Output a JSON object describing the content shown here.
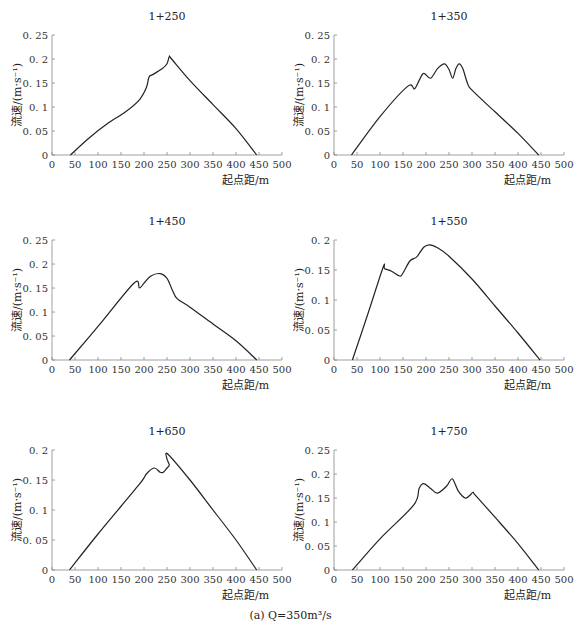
{
  "caption": "(a) Q=350m³/s",
  "x_axis_label": "起点距/m",
  "y_axis_label": "流速/(m·s⁻¹)",
  "chart_data": [
    {
      "type": "line",
      "title": "1+250",
      "xlabel": "起点距/m",
      "ylabel": "流速/(m·s⁻¹)",
      "xlim": [
        0,
        500
      ],
      "ylim": [
        0,
        0.25
      ],
      "xticks": [
        0,
        50,
        100,
        150,
        200,
        250,
        300,
        350,
        400,
        450,
        500
      ],
      "yticks": [
        "0",
        "0.05",
        "0.1",
        "0.15",
        "0.2",
        "0.25"
      ],
      "x": [
        40,
        80,
        120,
        160,
        190,
        205,
        210,
        213,
        220,
        240,
        250,
        255,
        260,
        300,
        350,
        400,
        445
      ],
      "y": [
        0,
        0.035,
        0.065,
        0.09,
        0.115,
        0.14,
        0.16,
        0.165,
        0.168,
        0.18,
        0.19,
        0.205,
        0.2,
        0.155,
        0.105,
        0.055,
        0
      ]
    },
    {
      "type": "line",
      "title": "1+350",
      "xlabel": "起点距/m",
      "ylabel": "流速/(m·s⁻¹)",
      "xlim": [
        0,
        500
      ],
      "ylim": [
        0,
        0.25
      ],
      "xticks": [
        0,
        50,
        100,
        150,
        200,
        250,
        300,
        350,
        400,
        450,
        500
      ],
      "yticks": [
        "0",
        "0.05",
        "0.1",
        "0.15",
        "0.2",
        "0.25"
      ],
      "x": [
        38,
        100,
        160,
        175,
        185,
        195,
        210,
        225,
        240,
        250,
        258,
        265,
        272,
        280,
        290,
        300,
        350,
        400,
        445
      ],
      "y": [
        0,
        0.08,
        0.143,
        0.138,
        0.155,
        0.17,
        0.16,
        0.18,
        0.19,
        0.178,
        0.16,
        0.18,
        0.19,
        0.18,
        0.15,
        0.135,
        0.09,
        0.045,
        0
      ]
    },
    {
      "type": "line",
      "title": "1+450",
      "xlabel": "起点距/m",
      "ylabel": "流速/(m·s⁻¹)",
      "xlim": [
        0,
        500
      ],
      "ylim": [
        0,
        0.25
      ],
      "xticks": [
        0,
        50,
        100,
        150,
        200,
        250,
        300,
        350,
        400,
        450,
        500
      ],
      "yticks": [
        "0",
        "0.05",
        "0.1",
        "0.15",
        "0.2",
        "0.25"
      ],
      "x": [
        38,
        100,
        178,
        190,
        200,
        215,
        235,
        250,
        262,
        272,
        300,
        350,
        400,
        445
      ],
      "y": [
        0,
        0.07,
        0.16,
        0.15,
        0.16,
        0.175,
        0.18,
        0.17,
        0.145,
        0.128,
        0.11,
        0.075,
        0.04,
        0
      ]
    },
    {
      "type": "line",
      "title": "1+550",
      "xlabel": "起点距/m",
      "ylabel": "流速/(m·s⁻¹)",
      "xlim": [
        0,
        500
      ],
      "ylim": [
        0,
        0.2
      ],
      "xticks": [
        0,
        50,
        100,
        150,
        200,
        250,
        300,
        350,
        400,
        450,
        500
      ],
      "yticks": [
        "0",
        "0.05",
        "0.1",
        "0.15",
        "0.2"
      ],
      "x": [
        40,
        75,
        107,
        110,
        125,
        143,
        150,
        165,
        180,
        195,
        208,
        225,
        250,
        300,
        350,
        400,
        448
      ],
      "y": [
        0,
        0.08,
        0.155,
        0.152,
        0.148,
        0.14,
        0.145,
        0.165,
        0.172,
        0.188,
        0.192,
        0.187,
        0.173,
        0.135,
        0.09,
        0.045,
        0
      ]
    },
    {
      "type": "line",
      "title": "1+650",
      "xlabel": "起点距/m",
      "ylabel": "流速/(m·s⁻¹)",
      "xlim": [
        0,
        500
      ],
      "ylim": [
        0,
        0.2
      ],
      "xticks": [
        0,
        50,
        100,
        150,
        200,
        250,
        300,
        350,
        400,
        450,
        500
      ],
      "yticks": [
        "0",
        "0.05",
        "0.1",
        "0.15",
        "0.2"
      ],
      "x": [
        38,
        100,
        190,
        205,
        222,
        235,
        242,
        250,
        255,
        250,
        252,
        300,
        350,
        400,
        445
      ],
      "y": [
        0,
        0.06,
        0.143,
        0.16,
        0.17,
        0.163,
        0.163,
        0.17,
        0.175,
        0.185,
        0.193,
        0.15,
        0.1,
        0.05,
        0
      ]
    },
    {
      "type": "line",
      "title": "1+750",
      "xlabel": "起点距/m",
      "ylabel": "流速/(m·s⁻¹)",
      "xlim": [
        0,
        500
      ],
      "ylim": [
        0,
        0.25
      ],
      "xticks": [
        0,
        50,
        100,
        150,
        200,
        250,
        300,
        350,
        400,
        450,
        500
      ],
      "yticks": [
        "0",
        "0.05",
        "0.1",
        "0.15",
        "0.2",
        "0.25"
      ],
      "x": [
        40,
        100,
        173,
        185,
        195,
        210,
        225,
        245,
        257,
        270,
        285,
        295,
        302,
        308,
        350,
        400,
        445
      ],
      "y": [
        0,
        0.065,
        0.135,
        0.17,
        0.18,
        0.17,
        0.16,
        0.175,
        0.19,
        0.165,
        0.15,
        0.155,
        0.162,
        0.155,
        0.11,
        0.055,
        0
      ]
    }
  ]
}
